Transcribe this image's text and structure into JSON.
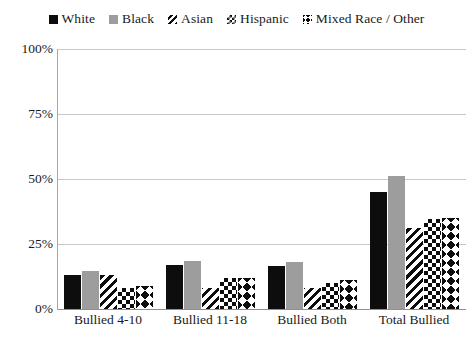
{
  "chart_data": {
    "type": "bar",
    "title": "",
    "xlabel": "",
    "ylabel": "",
    "ylim": [
      0,
      100
    ],
    "yticks": [
      0,
      25,
      50,
      75,
      100
    ],
    "ytick_labels": [
      "0%",
      "25%",
      "50%",
      "75%",
      "100%"
    ],
    "grid": true,
    "legend_position": "top",
    "categories": [
      "Bullied 4-10",
      "Bullied 11-18",
      "Bullied Both",
      "Total Bullied"
    ],
    "series": [
      {
        "name": "White",
        "pattern": "solid-black",
        "color": "#0d0d0d",
        "values": [
          13,
          17,
          16.5,
          45
        ]
      },
      {
        "name": "Black",
        "pattern": "solid-gray",
        "color": "#9d9d9d",
        "values": [
          14.5,
          18.5,
          18,
          51
        ]
      },
      {
        "name": "Asian",
        "pattern": "diagonal",
        "color": "#0d0d0d",
        "values": [
          13,
          8,
          8,
          31
        ]
      },
      {
        "name": "Hispanic",
        "pattern": "checker",
        "color": "#0d0d0d",
        "values": [
          8,
          12,
          10,
          34.5
        ]
      },
      {
        "name": "Mixed Race / Other",
        "pattern": "diamond",
        "color": "#0d0d0d",
        "values": [
          9,
          12,
          11,
          35
        ]
      }
    ]
  },
  "legend": {
    "items": [
      {
        "label": "White",
        "swatch": "square-black-icon"
      },
      {
        "label": "Black",
        "swatch": "square-gray-icon"
      },
      {
        "label": "Asian",
        "swatch": "diagonal-hatch-icon"
      },
      {
        "label": "Hispanic",
        "swatch": "checkerboard-icon"
      },
      {
        "label": "Mixed Race / Other",
        "swatch": "diamond-pattern-icon"
      }
    ]
  }
}
